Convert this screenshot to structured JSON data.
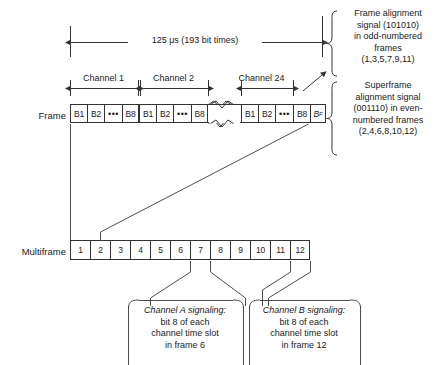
{
  "dimension": {
    "span_label": "125 μs (193 bit times)"
  },
  "channels": {
    "label_1": "Channel 1",
    "label_2": "Channel 2",
    "label_24": "Channel 24"
  },
  "frame_row": {
    "label": "Frame",
    "group1": [
      "B1",
      "B2",
      "•••",
      "B8"
    ],
    "group2": [
      "B1",
      "B2",
      "•••",
      "B8"
    ],
    "group24": [
      "B1",
      "B2",
      "•••",
      "B8"
    ],
    "framing_bit": "B",
    "framing_bit_sub": "F"
  },
  "multiframe_row": {
    "label": "Multiframe",
    "cells": [
      "1",
      "2",
      "3",
      "4",
      "5",
      "6",
      "7",
      "8",
      "9",
      "10",
      "11",
      "12"
    ]
  },
  "annotations": {
    "frame_alignment": {
      "lines": [
        "Frame alignment",
        "signal (101010)",
        "in odd-numbered",
        "frames",
        "(1,3,5,7,9,11)"
      ]
    },
    "superframe_alignment": {
      "lines": [
        "Superframe",
        "alignment signal",
        "(001110) in even-",
        "numbered frames",
        "(2,4,6,8,10,12)"
      ]
    },
    "channel_a": {
      "lines": [
        "Channel A signaling:",
        "bit 8 of each",
        "channel time slot",
        "in frame 6"
      ]
    },
    "channel_b": {
      "lines": [
        "Channel B signaling:",
        "bit 8 of each",
        "channel time slot",
        "in frame 12"
      ]
    }
  },
  "colors": {
    "line": "#333333",
    "text": "#1a1a1a",
    "background": "#ffffff"
  }
}
